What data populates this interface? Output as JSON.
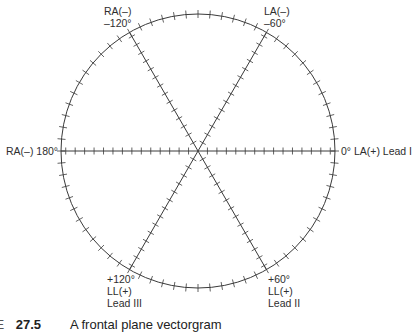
{
  "diagram": {
    "center": {
      "x": 198,
      "y": 151
    },
    "radius": 137,
    "stroke_color": "#3a3a3a",
    "circle_tick_step_deg": 5,
    "axis_ticks_per_radius": 14,
    "axes_deg": [
      0,
      60,
      120
    ],
    "labels": {
      "ra_minus_120": {
        "line1": "RA(–)",
        "line2": "–120°"
      },
      "la_minus_60": {
        "line1": "LA(–)",
        "line2": "–60°"
      },
      "ra_180": {
        "text": "RA(–) 180°"
      },
      "la_0_lead1": {
        "text": "0° LA(+) Lead I"
      },
      "ll_plus_120_lead3": {
        "line1": "+120°",
        "line2": "LL(+)",
        "line3": "Lead III"
      },
      "ll_plus_60_lead2": {
        "line1": "+60°",
        "line2": "LL(+)",
        "line3": "Lead II"
      }
    }
  },
  "caption": {
    "prefix": "RE",
    "number": "27.5",
    "text": "A frontal plane vectorgram"
  }
}
